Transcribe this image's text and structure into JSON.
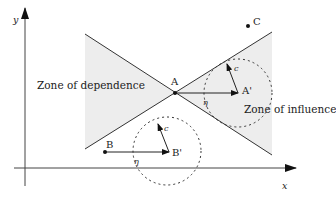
{
  "diagram": {
    "axes": {
      "x_label": "x",
      "y_label": "y"
    },
    "zones": {
      "dependence": "Zone of dependence",
      "influence": "Zone of influence"
    },
    "points": {
      "A": "A",
      "A_prime": "A'",
      "B": "B",
      "B_prime": "B'",
      "C": "C"
    },
    "vectors": {
      "c_at_A_prime": "c",
      "c_at_B_prime": "c",
      "eta_A": "η",
      "eta_B": "η"
    },
    "colors": {
      "line": "#333333",
      "shade": "#ededed",
      "text": "#222222"
    }
  }
}
